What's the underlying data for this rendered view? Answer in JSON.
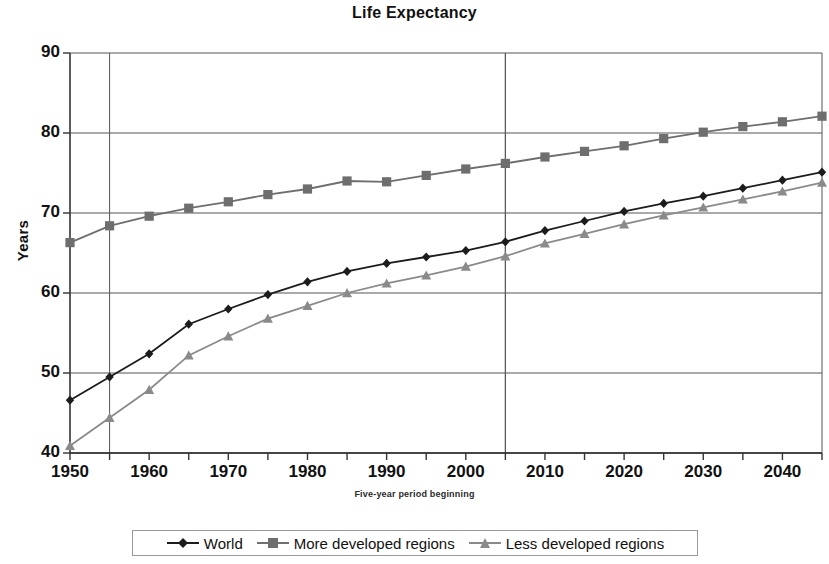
{
  "chart_data": {
    "type": "line",
    "title": "Life Expectancy",
    "xlabel": "Five-year period beginning",
    "ylabel": "Years",
    "xlim": [
      1950,
      2045
    ],
    "ylim": [
      40,
      90
    ],
    "ytick_step": 10,
    "xtick_step": 5,
    "xtick_label_step": 10,
    "grid": "horizontal and vertical gridlines",
    "legend_position": "bottom",
    "yticks": [
      "90",
      "80",
      "70",
      "60",
      "50",
      "40"
    ],
    "xticks": [
      "1950",
      "1960",
      "1970",
      "1980",
      "1990",
      "2000",
      "2010",
      "2020",
      "2030",
      "2040"
    ],
    "x": [
      1950,
      1955,
      1960,
      1965,
      1970,
      1975,
      1980,
      1985,
      1990,
      1995,
      2000,
      2005,
      2010,
      2015,
      2020,
      2025,
      2030,
      2035,
      2040,
      2045
    ],
    "series": [
      {
        "name": "World",
        "marker": "diamond",
        "color": "#1c1c1c",
        "values": [
          46.6,
          49.5,
          52.4,
          56.1,
          58.0,
          59.8,
          61.4,
          62.7,
          63.7,
          64.5,
          65.3,
          66.4,
          67.8,
          69.0,
          70.2,
          71.2,
          72.1,
          73.1,
          74.1,
          75.1
        ]
      },
      {
        "name": "More developed regions",
        "marker": "square",
        "color": "#6e6e6e",
        "values": [
          66.3,
          68.4,
          69.6,
          70.6,
          71.4,
          72.3,
          73.0,
          74.0,
          73.9,
          74.7,
          75.5,
          76.2,
          77.0,
          77.7,
          78.4,
          79.3,
          80.1,
          80.8,
          81.4,
          82.1
        ]
      },
      {
        "name": "Less developed regions",
        "marker": "triangle",
        "color": "#8a8a8a",
        "values": [
          40.9,
          44.4,
          47.9,
          52.2,
          54.6,
          56.8,
          58.4,
          60.0,
          61.2,
          62.2,
          63.3,
          64.6,
          66.2,
          67.4,
          68.6,
          69.7,
          70.7,
          71.7,
          72.7,
          73.8
        ]
      }
    ]
  },
  "legend": {
    "items": [
      {
        "label": "World"
      },
      {
        "label": "More developed regions"
      },
      {
        "label": "Less developed regions"
      }
    ]
  }
}
